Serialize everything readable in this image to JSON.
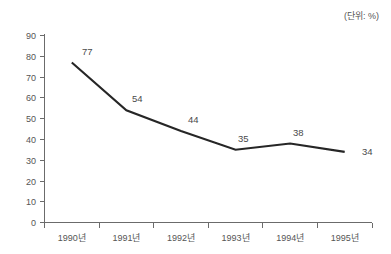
{
  "annotation": {
    "unit_note": "(단위: %)"
  },
  "chart_data": {
    "type": "line",
    "title": "",
    "subtitle": "",
    "xlabel": "",
    "ylabel": "",
    "unit_note": "(단위: %)",
    "categories": [
      "1990년",
      "1991년",
      "1992년",
      "1993년",
      "1994년",
      "1995년"
    ],
    "values": [
      77,
      54,
      44,
      35,
      38,
      34
    ],
    "point_labels": [
      "77",
      "54",
      "44",
      "35",
      "38",
      "34"
    ],
    "ylim": [
      0,
      90
    ],
    "ytick_values": [
      0,
      10,
      20,
      30,
      40,
      50,
      60,
      70,
      80,
      90
    ],
    "ytick_labels": [
      "0",
      "10",
      "20",
      "30",
      "40",
      "50",
      "60",
      "70",
      "80",
      "90"
    ],
    "grid": false,
    "legend": null,
    "legend_position": "none",
    "series": [
      {
        "name": "",
        "values": [
          77,
          54,
          44,
          35,
          38,
          34
        ],
        "color": "#262626"
      }
    ],
    "colors": {
      "line": "#262626",
      "axis": "#6b6b6b",
      "text": "#555555",
      "background": "#ffffff"
    }
  }
}
